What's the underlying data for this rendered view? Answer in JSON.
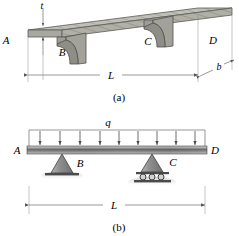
{
  "figure": {
    "type": "engineering-diagram"
  },
  "panel_a": {
    "caption": "(a)",
    "points": {
      "A": "A",
      "B": "B",
      "C": "C",
      "D": "D"
    },
    "dimensions": {
      "thickness": "t",
      "length": "L",
      "depth": "b"
    },
    "colors": {
      "slab_face": "#b9b9b0",
      "slab_edge": "#8f8f88",
      "bracket": "#9a9a93",
      "outline": "#4a4a4a",
      "dim_line": "#6e6e6e"
    }
  },
  "panel_b": {
    "caption": "(b)",
    "points": {
      "A": "A",
      "B": "B",
      "C": "C",
      "D": "D"
    },
    "load": {
      "label": "q",
      "arrow_count": 9,
      "direction": "down"
    },
    "dimensions": {
      "length": "L"
    },
    "supports": {
      "B": "pin-support",
      "C": "roller-support"
    },
    "colors": {
      "beam_dark": "#5d5d5d",
      "beam_light": "#d8d8d8",
      "support": "#8d8d8d",
      "outline": "#3a3a3a"
    }
  }
}
